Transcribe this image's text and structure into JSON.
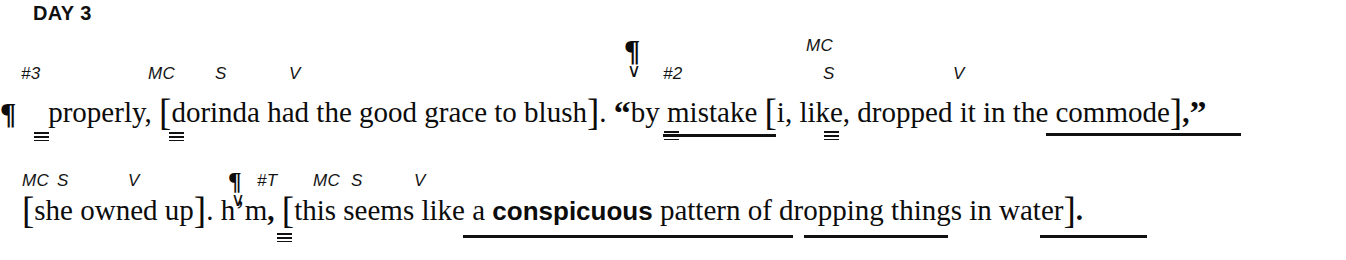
{
  "header": {
    "title": "DAY 3"
  },
  "symbols": {
    "pilcrow": "¶",
    "check": "∨",
    "open_bracket": "[",
    "close_bracket": "]",
    "open_quote": "“",
    "close_quote": "”",
    "period": ".",
    "comma": ","
  },
  "lines": [
    {
      "id": "line-1",
      "labels": [
        {
          "text": "#3",
          "x": 21,
          "y": 64
        },
        {
          "text": "MC",
          "x": 148,
          "y": 64
        },
        {
          "text": "S",
          "x": 215,
          "y": 64
        },
        {
          "text": "V",
          "x": 289,
          "y": 64
        },
        {
          "text": "#2",
          "x": 663,
          "y": 64
        },
        {
          "text": "MC",
          "x": 806,
          "y": 36
        },
        {
          "text": "S",
          "x": 823,
          "y": 64
        },
        {
          "text": "V",
          "x": 953,
          "y": 64
        }
      ],
      "tokens": [
        {
          "type": "pilcrow"
        },
        {
          "type": "text",
          "text": "properly,"
        },
        {
          "type": "bracket",
          "text": "["
        },
        {
          "type": "text",
          "text": "dorinda had the good grace to blush"
        },
        {
          "type": "bracket",
          "text": "]"
        },
        {
          "type": "text",
          "text": "."
        },
        {
          "type": "quote",
          "text": "“"
        },
        {
          "type": "text",
          "text": "by mistake"
        },
        {
          "type": "bracket",
          "text": "["
        },
        {
          "type": "text",
          "text": "i, like, dropped it in the commode"
        },
        {
          "type": "bracket",
          "text": "]"
        },
        {
          "type": "text",
          "text": ","
        },
        {
          "type": "quote",
          "text": "”"
        }
      ],
      "plain_text": "¶ properly, [dorinda had the good grace to blush]. “by mistake [i, like, dropped it in the commode],”"
    },
    {
      "id": "line-2",
      "labels": [
        {
          "text": "MC",
          "x": 22,
          "y": 171
        },
        {
          "text": "S",
          "x": 57,
          "y": 171
        },
        {
          "text": "V",
          "x": 128,
          "y": 171
        },
        {
          "text": "#T",
          "x": 257,
          "y": 171
        },
        {
          "text": "MC",
          "x": 313,
          "y": 171
        },
        {
          "text": "S",
          "x": 351,
          "y": 171
        },
        {
          "text": "V",
          "x": 414,
          "y": 171
        }
      ],
      "tokens": [
        {
          "type": "bracket",
          "text": "["
        },
        {
          "type": "text",
          "text": "she owned up"
        },
        {
          "type": "bracket",
          "text": "]"
        },
        {
          "type": "text",
          "text": "."
        },
        {
          "type": "text",
          "text": "h’m"
        },
        {
          "type": "text",
          "text": ","
        },
        {
          "type": "bracket",
          "text": "["
        },
        {
          "type": "text",
          "text": "this seems like a "
        },
        {
          "type": "bold",
          "text": "conspicuous"
        },
        {
          "type": "text",
          "text": " pattern of dropping things in water"
        },
        {
          "type": "bracket",
          "text": "]"
        },
        {
          "type": "text",
          "text": "."
        }
      ],
      "plain_text": "[she owned up]. h’m, [this seems like a conspicuous pattern of dropping things in water]."
    }
  ],
  "pilcrows": [
    {
      "name": "pilcrow-line1-start",
      "x": 0,
      "y": 96,
      "size": "large",
      "check": false
    },
    {
      "name": "pilcrow-hash2",
      "x": 624,
      "y": 33,
      "size": "large",
      "check": true
    },
    {
      "name": "pilcrow-hashT",
      "x": 228,
      "y": 168,
      "size": "small",
      "check": true
    }
  ],
  "cap_marks": [
    {
      "name": "cap-mark-properly",
      "x": 34,
      "y": 132
    },
    {
      "name": "cap-mark-dorinda",
      "x": 169,
      "y": 132
    },
    {
      "name": "cap-mark-by",
      "x": 664,
      "y": 131
    },
    {
      "name": "cap-mark-i",
      "x": 824,
      "y": 131
    },
    {
      "name": "cap-mark-hm",
      "x": 277,
      "y": 233
    }
  ],
  "underlines": [
    {
      "name": "underline-by-mistake",
      "x": 663,
      "y": 134,
      "width": 113
    },
    {
      "name": "underline-in-the-commode",
      "x": 1046,
      "y": 133,
      "width": 195
    },
    {
      "name": "underline-like-a-conspicuous-pattern",
      "x": 463,
      "y": 235,
      "width": 330
    },
    {
      "name": "underline-of-dropping-things",
      "x": 804,
      "y": 235,
      "width": 144
    },
    {
      "name": "underline-in-water",
      "x": 1040,
      "y": 235,
      "width": 107
    }
  ],
  "colors": {
    "background": "#ffffff",
    "ink": "#101010"
  }
}
